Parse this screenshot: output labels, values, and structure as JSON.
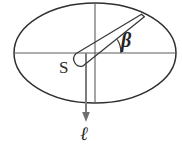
{
  "figure": {
    "labels": {
      "angle": "β",
      "surface": "S",
      "axis": "ℓ"
    },
    "colors": {
      "outline": "#2f2f2f",
      "axis_line": "#5c5c5c",
      "arrow": "#7a7a7a",
      "needle": "#3a3a3a",
      "background": "#ffffff"
    },
    "geometry": {
      "ellipse": {
        "cx": 95,
        "cy": 53,
        "rx": 81,
        "ry": 50
      },
      "center_point": {
        "x": 95,
        "y": 53
      },
      "horizontal_diameter": {
        "x1": 14,
        "y1": 53,
        "x2": 176,
        "y2": 53
      },
      "vertical_axis": {
        "x1": 95,
        "y1": 3,
        "x2": 95,
        "y2": 103
      },
      "arrow_line": {
        "x1": 86,
        "y1": 53,
        "x2": 86,
        "y2": 122
      },
      "needle_tip": {
        "x": 143,
        "y": 15
      },
      "needle_tail": {
        "x": 76,
        "y": 62
      },
      "angle_arc_radius": 26,
      "angle_degrees": 31
    }
  }
}
